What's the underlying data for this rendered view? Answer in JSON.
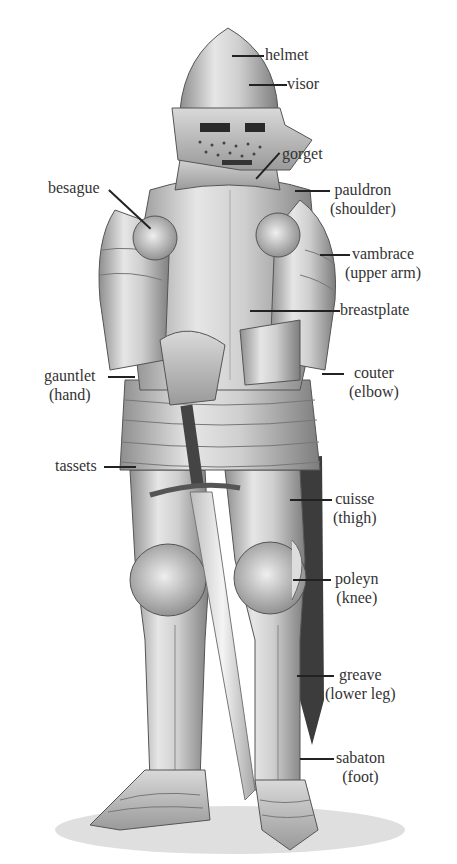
{
  "diagram": {
    "labels": [
      {
        "id": "helmet",
        "name": "helmet",
        "sub": ""
      },
      {
        "id": "visor",
        "name": "visor",
        "sub": ""
      },
      {
        "id": "gorget",
        "name": "gorget",
        "sub": ""
      },
      {
        "id": "besague",
        "name": "besague",
        "sub": ""
      },
      {
        "id": "pauldron",
        "name": "pauldron",
        "sub": "(shoulder)"
      },
      {
        "id": "vambrace",
        "name": "vambrace",
        "sub": "(upper arm)"
      },
      {
        "id": "breastplate",
        "name": "breastplate",
        "sub": ""
      },
      {
        "id": "gauntlet",
        "name": "gauntlet",
        "sub": "(hand)"
      },
      {
        "id": "couter",
        "name": "couter",
        "sub": "(elbow)"
      },
      {
        "id": "tassets",
        "name": "tassets",
        "sub": ""
      },
      {
        "id": "cuisse",
        "name": "cuisse",
        "sub": "(thigh)"
      },
      {
        "id": "poleyn",
        "name": "poleyn",
        "sub": "(knee)"
      },
      {
        "id": "greave",
        "name": "greave",
        "sub": "(lower leg)"
      },
      {
        "id": "sabaton",
        "name": "sabaton",
        "sub": "(foot)"
      }
    ]
  }
}
